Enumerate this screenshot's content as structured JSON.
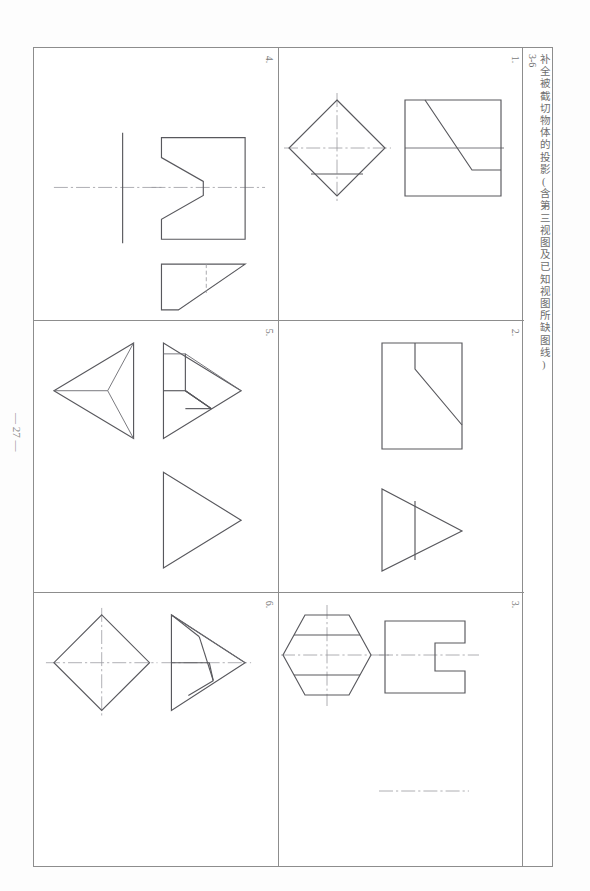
{
  "page": {
    "number_label": "— 27 —",
    "sheet_title_code": "3-6",
    "sheet_title": "补全被截切物体的投影(含第三视图及已知视图所缺图线)"
  },
  "worksheet": {
    "columns": 2,
    "rows": 3,
    "cells": [
      {
        "number": "4.",
        "position": "row1-left",
        "description": "缺口棱柱:左侧十字中心线、主视图带V形缺口、俯视图梯形带虚线",
        "views": [
          "centerline-cross",
          "front-view-v-notch",
          "top-view-trapezoid"
        ]
      },
      {
        "number": "1.",
        "position": "row1-right",
        "description": "四棱柱被截切:俯视图为菱形带水平截交线、主视图为方形带斜截面",
        "views": [
          "top-view-diamond",
          "front-view-square-with-bevel"
        ]
      },
      {
        "number": "5.",
        "position": "row2-left",
        "description": "三棱锥被截切:俯视图为左向三角锥、主视图为右向三角形带截交线、左视图三角形",
        "views": [
          "top-view-pyramid-left",
          "front-view-triangle-cut",
          "side-view-triangle"
        ]
      },
      {
        "number": "2.",
        "position": "row2-right",
        "description": "长方体切角:主视图为带倒角矩形、俯视图三角形带分界线",
        "views": [
          "front-view-rect-chamfer",
          "top-view-triangle-divided"
        ]
      },
      {
        "number": "6.",
        "position": "row3-left",
        "description": "四棱锥被截切:俯视图为菱形带中心线、主视图为三角形带截断面",
        "views": [
          "top-view-diamond-centered",
          "front-view-triangle-cut"
        ]
      },
      {
        "number": "3.",
        "position": "row3-right",
        "description": "六棱柱开槽:俯视图为六边形带两条截交线、主视图为带凹槽矩形",
        "views": [
          "top-view-hexagon",
          "front-view-slotted-rect",
          "centerline-below"
        ]
      }
    ]
  },
  "line_types": {
    "visible_outline": "#58585d",
    "center_line": "#9a9aa0",
    "hidden_line": "#9a9aa0",
    "border": "#8d8d8d"
  }
}
